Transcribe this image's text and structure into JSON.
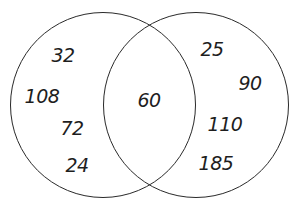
{
  "venn": {
    "stroke_color": "#2a2a2a",
    "text_color": "#1e1e1e",
    "circles": [
      {
        "id": "left",
        "cx": 103,
        "cy": 105,
        "r": 93
      },
      {
        "id": "right",
        "cx": 196,
        "cy": 105,
        "r": 93
      }
    ],
    "left_only": {
      "values": [
        "32",
        "108",
        "72",
        "24"
      ],
      "positions": [
        [
          63,
          55
        ],
        [
          42,
          96
        ],
        [
          72,
          128
        ],
        [
          77,
          165
        ]
      ]
    },
    "intersection": {
      "values": [
        "60"
      ],
      "positions": [
        [
          149,
          100
        ]
      ]
    },
    "right_only": {
      "values": [
        "25",
        "90",
        "110",
        "185"
      ],
      "positions": [
        [
          212,
          49
        ],
        [
          250,
          83
        ],
        [
          225,
          124
        ],
        [
          216,
          163
        ]
      ]
    }
  }
}
